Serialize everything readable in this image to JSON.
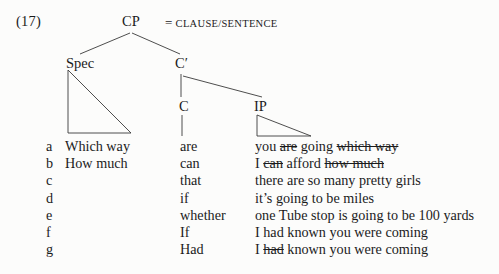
{
  "figure": {
    "example_number": "(17)",
    "legend": {
      "equals": "=",
      "text": "CLAUSE/SENTENCE"
    }
  },
  "tree": {
    "nodes": {
      "cp": "CP",
      "spec": "Spec",
      "c_bar": "C′",
      "c": "C",
      "ip": "IP"
    }
  },
  "examples": {
    "columns": [
      "label",
      "spec",
      "c",
      "ip"
    ],
    "rows": [
      {
        "label": "a",
        "spec": "Which way",
        "c": "are",
        "ip_parts": [
          {
            "text": "you ",
            "strike": false
          },
          {
            "text": "are",
            "strike": true
          },
          {
            "text": " going ",
            "strike": false
          },
          {
            "text": "which way",
            "strike": true
          }
        ]
      },
      {
        "label": "b",
        "spec": "How much",
        "c": "can",
        "ip_parts": [
          {
            "text": "I ",
            "strike": false
          },
          {
            "text": "can",
            "strike": true
          },
          {
            "text": " afford ",
            "strike": false
          },
          {
            "text": "how much",
            "strike": true
          }
        ]
      },
      {
        "label": "c",
        "spec": "",
        "c": "that",
        "ip_parts": [
          {
            "text": "there are so many pretty girls",
            "strike": false
          }
        ]
      },
      {
        "label": "d",
        "spec": "",
        "c": "if",
        "ip_parts": [
          {
            "text": "it’s going to be miles",
            "strike": false
          }
        ]
      },
      {
        "label": "e",
        "spec": "",
        "c": "whether",
        "ip_parts": [
          {
            "text": "one Tube stop is going to be 100 yards",
            "strike": false
          }
        ]
      },
      {
        "label": "f",
        "spec": "",
        "c": "If",
        "ip_parts": [
          {
            "text": "I had known you were coming",
            "strike": false
          }
        ]
      },
      {
        "label": "g",
        "spec": "",
        "c": "Had",
        "ip_parts": [
          {
            "text": "I ",
            "strike": false
          },
          {
            "text": "had",
            "strike": true
          },
          {
            "text": " known you were coming",
            "strike": false
          }
        ]
      }
    ]
  }
}
